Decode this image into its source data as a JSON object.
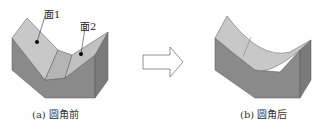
{
  "figure_a": {
    "caption": "(a) 圆角前",
    "labels": {
      "face1": "面1",
      "face2": "面2"
    }
  },
  "figure_b": {
    "caption": "(b) 圆角后"
  },
  "arrow": {
    "icon": "right-arrow-icon"
  },
  "colors": {
    "top_face": "#c8c8c8",
    "front_face": "#8a8a8a",
    "side_face": "#7a7a7a",
    "edge": "#555555"
  }
}
